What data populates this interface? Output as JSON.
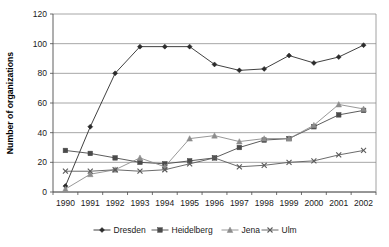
{
  "chart_data": {
    "type": "line",
    "title": "",
    "xlabel": "",
    "ylabel": "Number of organizations",
    "categories": [
      "1990",
      "1991",
      "1992",
      "1993",
      "1994",
      "1995",
      "1996",
      "1997",
      "1998",
      "1999",
      "2000",
      "2001",
      "2002"
    ],
    "ylim": [
      0,
      120
    ],
    "ytick_step": 20,
    "yticks": [
      "0",
      "20",
      "40",
      "60",
      "80",
      "100",
      "120"
    ],
    "grid": "horizontal",
    "legend_position": "bottom",
    "series": [
      {
        "name": "Dresden",
        "marker": "diamond",
        "color": "#2b2b2b",
        "values": [
          4,
          44,
          80,
          98,
          98,
          98,
          86,
          82,
          83,
          92,
          87,
          91,
          99
        ]
      },
      {
        "name": "Heidelberg",
        "marker": "square",
        "color": "#4a4a4a",
        "values": [
          28,
          26,
          23,
          20,
          19,
          21,
          23,
          30,
          35,
          36,
          44,
          52,
          55
        ]
      },
      {
        "name": "Jena",
        "marker": "triangle",
        "color": "#8c8c8c",
        "values": [
          2,
          12,
          15,
          23,
          17,
          36,
          38,
          34,
          36,
          36,
          45,
          59,
          56
        ]
      },
      {
        "name": "Ulm",
        "marker": "cross",
        "color": "#5a5a5a",
        "values": [
          14,
          14,
          15,
          14,
          15,
          19,
          23,
          17,
          18,
          20,
          21,
          25,
          28
        ]
      }
    ]
  },
  "legend": {
    "items": [
      {
        "label": "Dresden"
      },
      {
        "label": "Heidelberg"
      },
      {
        "label": "Jena"
      },
      {
        "label": "Ulm"
      }
    ]
  },
  "axes": {
    "y_title": "Number of organizations"
  },
  "colors": {
    "gridline": "#909090",
    "axis": "#4d4d4d",
    "background": "#ffffff"
  }
}
